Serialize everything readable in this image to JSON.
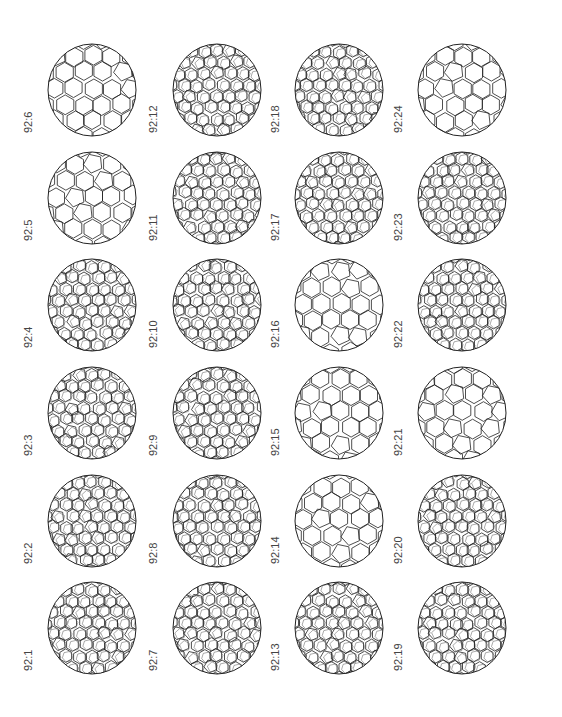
{
  "figure": {
    "columns": [
      {
        "labels_top_to_bottom": [
          "92:6",
          "92:5",
          "92:4",
          "92:3",
          "92:2",
          "92:1"
        ]
      },
      {
        "labels_top_to_bottom": [
          "92:12",
          "92:11",
          "92:10",
          "92:9",
          "92:8",
          "92:7"
        ]
      },
      {
        "labels_top_to_bottom": [
          "92:18",
          "92:17",
          "92:16",
          "92:15",
          "92:14",
          "92:13"
        ]
      },
      {
        "labels_top_to_bottom": [
          "92:24",
          "92:23",
          "92:22",
          "92:21",
          "92:20",
          "92:19"
        ]
      }
    ]
  },
  "cells": [
    {
      "label": "92:6",
      "col": 0,
      "row": 0
    },
    {
      "label": "92:5",
      "col": 0,
      "row": 1
    },
    {
      "label": "92:4",
      "col": 0,
      "row": 2
    },
    {
      "label": "92:3",
      "col": 0,
      "row": 3
    },
    {
      "label": "92:2",
      "col": 0,
      "row": 4
    },
    {
      "label": "92:1",
      "col": 0,
      "row": 5
    },
    {
      "label": "92:12",
      "col": 1,
      "row": 0
    },
    {
      "label": "92:11",
      "col": 1,
      "row": 1
    },
    {
      "label": "92:10",
      "col": 1,
      "row": 2
    },
    {
      "label": "92:9",
      "col": 1,
      "row": 3
    },
    {
      "label": "92:8",
      "col": 1,
      "row": 4
    },
    {
      "label": "92:7",
      "col": 1,
      "row": 5
    },
    {
      "label": "92:18",
      "col": 2,
      "row": 0
    },
    {
      "label": "92:17",
      "col": 2,
      "row": 1
    },
    {
      "label": "92:16",
      "col": 2,
      "row": 2
    },
    {
      "label": "92:15",
      "col": 2,
      "row": 3
    },
    {
      "label": "92:14",
      "col": 2,
      "row": 4
    },
    {
      "label": "92:13",
      "col": 2,
      "row": 5
    },
    {
      "label": "92:24",
      "col": 3,
      "row": 0
    },
    {
      "label": "92:23",
      "col": 3,
      "row": 1
    },
    {
      "label": "92:22",
      "col": 3,
      "row": 2
    },
    {
      "label": "92:21",
      "col": 3,
      "row": 3
    },
    {
      "label": "92:20",
      "col": 3,
      "row": 4
    },
    {
      "label": "92:19",
      "col": 3,
      "row": 5
    }
  ]
}
